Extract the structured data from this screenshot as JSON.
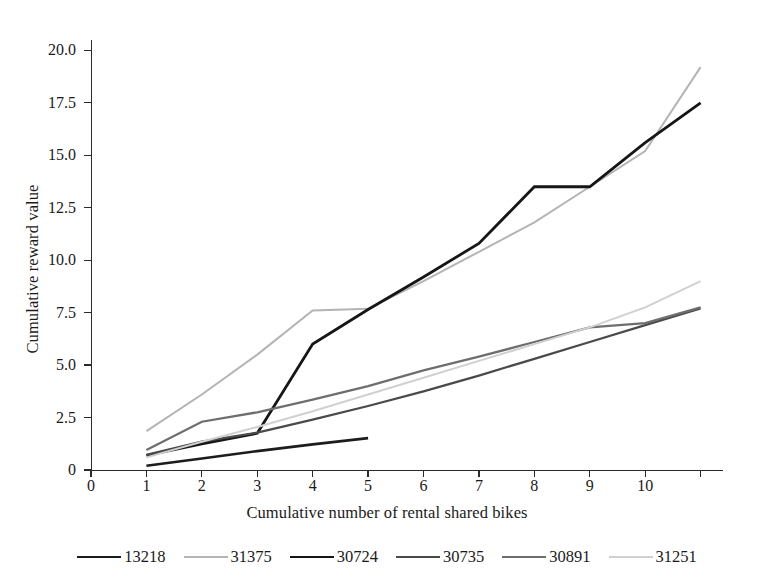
{
  "chart_data": {
    "type": "line",
    "title": "",
    "xlabel": "Cumulative number of rental shared bikes",
    "ylabel": "Cumulative reward value",
    "xlim": [
      0,
      11.35
    ],
    "ylim": [
      0,
      20.35
    ],
    "xticks": [
      0,
      1,
      2,
      3,
      4,
      5,
      6,
      7,
      8,
      9,
      10,
      11
    ],
    "xticklabels": [
      "0",
      "1",
      "2",
      "3",
      "4",
      "5",
      "6",
      "7",
      "8",
      "9",
      "10",
      ""
    ],
    "yticks": [
      0,
      2.5,
      5.0,
      7.5,
      10.0,
      12.5,
      15.0,
      17.5,
      20.0
    ],
    "yticklabels": [
      "0",
      "2.5",
      "5.0",
      "7.5",
      "10.0",
      "12.5",
      "15.0",
      "17.5",
      "20.0"
    ],
    "grid": false,
    "legend_position": "below-center",
    "series": [
      {
        "name": "13218",
        "color": "#1c1c1c",
        "width": 2.6,
        "x": [
          1,
          2,
          3,
          4,
          5
        ],
        "y": [
          0.2,
          0.55,
          0.9,
          1.22,
          1.52
        ]
      },
      {
        "name": "31375",
        "color": "#b4b4b4",
        "width": 2.0,
        "x": [
          1,
          2,
          3,
          4,
          5,
          6,
          7,
          8,
          9,
          10,
          11
        ],
        "y": [
          1.85,
          3.6,
          5.5,
          7.6,
          7.68,
          9.0,
          10.4,
          11.8,
          13.5,
          15.2,
          19.2
        ]
      },
      {
        "name": "30724",
        "color": "#161616",
        "width": 2.8,
        "x": [
          1,
          2,
          3,
          4,
          5,
          6,
          7,
          8,
          9,
          10,
          11
        ],
        "y": [
          0.7,
          1.25,
          1.75,
          6.0,
          7.65,
          9.2,
          10.8,
          13.5,
          13.5,
          15.6,
          17.5
        ]
      },
      {
        "name": "30735",
        "color": "#4a4a4a",
        "width": 2.3,
        "x": [
          1,
          2,
          3,
          4,
          5,
          6,
          7,
          8,
          9,
          10,
          11
        ],
        "y": [
          0.72,
          1.35,
          1.78,
          2.4,
          3.05,
          3.75,
          4.5,
          5.3,
          6.1,
          6.9,
          7.7
        ]
      },
      {
        "name": "30891",
        "color": "#6e6e6e",
        "width": 2.3,
        "x": [
          1,
          2,
          3,
          4,
          5,
          6,
          7,
          8,
          9,
          10,
          11
        ],
        "y": [
          0.95,
          2.3,
          2.75,
          3.35,
          4.0,
          4.75,
          5.4,
          6.1,
          6.8,
          7.0,
          7.75
        ]
      },
      {
        "name": "31251",
        "color": "#d0d0d0",
        "width": 2.0,
        "x": [
          1,
          2,
          3,
          4,
          5,
          6,
          7,
          8,
          9,
          10,
          11
        ],
        "y": [
          0.6,
          1.35,
          2.05,
          2.8,
          3.6,
          4.4,
          5.2,
          6.0,
          6.8,
          7.75,
          9.0
        ]
      }
    ]
  },
  "legend": {
    "items": [
      {
        "label": "13218",
        "color": "#1c1c1c",
        "width": 2.6
      },
      {
        "label": "31375",
        "color": "#b4b4b4",
        "width": 2.0
      },
      {
        "label": "30724",
        "color": "#161616",
        "width": 2.8
      },
      {
        "label": "30735",
        "color": "#4a4a4a",
        "width": 2.3
      },
      {
        "label": "30891",
        "color": "#6e6e6e",
        "width": 2.3
      },
      {
        "label": "31251",
        "color": "#d0d0d0",
        "width": 2.0
      }
    ]
  }
}
